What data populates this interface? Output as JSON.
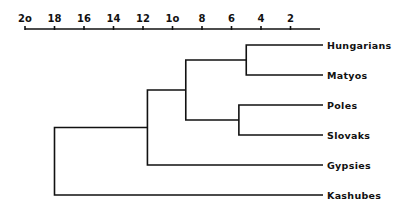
{
  "chart_data": {
    "type": "dendrogram",
    "title": "",
    "xlabel": "",
    "ylabel": "",
    "axis": {
      "position": "top",
      "range": [
        20,
        0
      ],
      "ticks": [
        20,
        18,
        16,
        14,
        12,
        10,
        8,
        6,
        4,
        2
      ],
      "tick_labels": [
        "2o",
        "18",
        "16",
        "14",
        "12",
        "1o",
        "8",
        "6",
        "4",
        "2"
      ],
      "grid": false
    },
    "leaves": [
      "Hungarians",
      "Matyos",
      "Poles",
      "Slovaks",
      "Gypsies",
      "Kashubes"
    ],
    "merges": [
      {
        "members": [
          "Hungarians",
          "Matyos"
        ],
        "height": 5.0
      },
      {
        "members": [
          "Poles",
          "Slovaks"
        ],
        "height": 5.5
      },
      {
        "members": [
          "Hungarians+Matyos",
          "Poles+Slovaks"
        ],
        "height": 9.1
      },
      {
        "members": [
          "Hungarians+Matyos+Poles+Slovaks",
          "Gypsies"
        ],
        "height": 11.7
      },
      {
        "members": [
          "Hungarians+Matyos+Poles+Slovaks+Gypsies",
          "Kashubes"
        ],
        "height": 18.0
      }
    ]
  }
}
